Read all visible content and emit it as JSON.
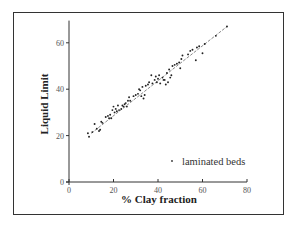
{
  "chart_data": {
    "type": "scatter",
    "title": "",
    "xlabel": "% Clay fraction",
    "ylabel": "Liquid Limit",
    "xlim": [
      0,
      80
    ],
    "ylim": [
      0,
      70
    ],
    "xticks": [
      0,
      20,
      40,
      60,
      80
    ],
    "yticks": [
      0,
      20,
      40,
      60
    ],
    "grid": false,
    "legend_position": "lower right",
    "series": [
      {
        "name": "laminated beds",
        "marker": "dot",
        "points": [
          [
            8.5,
            21
          ],
          [
            9,
            19.5
          ],
          [
            10.5,
            21.5
          ],
          [
            11.5,
            25
          ],
          [
            12.5,
            23
          ],
          [
            13.5,
            22
          ],
          [
            14,
            22.5
          ],
          [
            14.5,
            26
          ],
          [
            15,
            25.5
          ],
          [
            16.5,
            28
          ],
          [
            17.5,
            28.5
          ],
          [
            18,
            27.5
          ],
          [
            18.5,
            29
          ],
          [
            19,
            27.5
          ],
          [
            19.5,
            31
          ],
          [
            20,
            32.5
          ],
          [
            20.5,
            30
          ],
          [
            21,
            31.5
          ],
          [
            21.5,
            30.5
          ],
          [
            22,
            33
          ],
          [
            22.5,
            31
          ],
          [
            23.5,
            31.5
          ],
          [
            24,
            33
          ],
          [
            24.5,
            32.5
          ],
          [
            25,
            33.5
          ],
          [
            25.5,
            34
          ],
          [
            26,
            32.5
          ],
          [
            26.5,
            35
          ],
          [
            27,
            36.5
          ],
          [
            27.5,
            35
          ],
          [
            29,
            37
          ],
          [
            30,
            37.5
          ],
          [
            31,
            38
          ],
          [
            31.5,
            40
          ],
          [
            32,
            39.5
          ],
          [
            32.5,
            37
          ],
          [
            33,
            41
          ],
          [
            33.5,
            36
          ],
          [
            34,
            37.5
          ],
          [
            34.5,
            41.5
          ],
          [
            35.5,
            42
          ],
          [
            36,
            43
          ],
          [
            37,
            46
          ],
          [
            37.5,
            42.5
          ],
          [
            38.5,
            44
          ],
          [
            39,
            45.5
          ],
          [
            39.5,
            43
          ],
          [
            40,
            44.5
          ],
          [
            40.5,
            46
          ],
          [
            41,
            42.5
          ],
          [
            42,
            45
          ],
          [
            42.5,
            44
          ],
          [
            43,
            44
          ],
          [
            43.5,
            42
          ],
          [
            44,
            47
          ],
          [
            44.5,
            43
          ],
          [
            45,
            48.5
          ],
          [
            45.5,
            45
          ],
          [
            46,
            46
          ],
          [
            46.5,
            50
          ],
          [
            47.5,
            50.5
          ],
          [
            48.5,
            51
          ],
          [
            49.5,
            51.5
          ],
          [
            50,
            49
          ],
          [
            50.5,
            53
          ],
          [
            51,
            54.5
          ],
          [
            53.5,
            55
          ],
          [
            54.5,
            56.5
          ],
          [
            55.5,
            57
          ],
          [
            57,
            52.5
          ],
          [
            57.5,
            58
          ],
          [
            58.5,
            58.5
          ],
          [
            60,
            55.5
          ],
          [
            61,
            59.5
          ],
          [
            66,
            63
          ],
          [
            71,
            67
          ]
        ]
      }
    ],
    "trend_line": {
      "style": "dashed",
      "from": [
        10,
        21
      ],
      "to": [
        71,
        67
      ]
    }
  },
  "legend": {
    "label": "laminated beds"
  },
  "axes": {
    "x_title": "% Clay fraction",
    "y_title": "Liquid Limit",
    "x_tick_labels": [
      "0",
      "20",
      "40",
      "60",
      "80"
    ],
    "y_tick_labels": [
      "0",
      "20",
      "40",
      "60"
    ]
  }
}
